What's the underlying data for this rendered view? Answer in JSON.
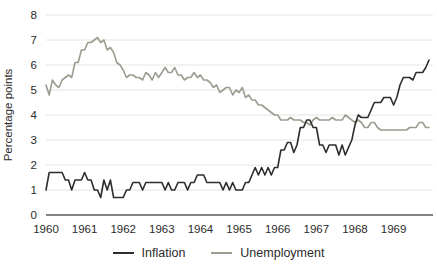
{
  "chart_data": {
    "type": "line",
    "title": "",
    "xlabel": "",
    "ylabel": "Percentage points",
    "frequency": "monthly",
    "x_start_year": 1960,
    "x_tick_labels": [
      "1960",
      "1961",
      "1962",
      "1963",
      "1964",
      "1965",
      "1966",
      "1967",
      "1968",
      "1969"
    ],
    "y_ticks": [
      0,
      1,
      2,
      3,
      4,
      5,
      6,
      7,
      8
    ],
    "ylim": [
      0,
      8
    ],
    "grid": "horizontal",
    "legend_position": "bottom",
    "series": [
      {
        "name": "Inflation",
        "color": "#2d2d2d",
        "values": [
          1.0,
          1.7,
          1.7,
          1.7,
          1.7,
          1.7,
          1.4,
          1.4,
          1.0,
          1.4,
          1.4,
          1.4,
          1.7,
          1.4,
          1.4,
          1.0,
          1.0,
          0.7,
          1.4,
          1.0,
          1.4,
          0.7,
          0.7,
          0.7,
          0.7,
          1.0,
          1.0,
          1.3,
          1.3,
          1.3,
          1.0,
          1.3,
          1.3,
          1.3,
          1.3,
          1.3,
          1.3,
          1.0,
          1.3,
          1.0,
          1.0,
          1.3,
          1.3,
          1.3,
          1.0,
          1.3,
          1.3,
          1.6,
          1.6,
          1.6,
          1.3,
          1.3,
          1.3,
          1.3,
          1.3,
          1.0,
          1.3,
          1.0,
          1.3,
          1.0,
          1.0,
          1.0,
          1.3,
          1.3,
          1.6,
          1.9,
          1.6,
          1.9,
          1.6,
          1.9,
          1.6,
          1.9,
          1.9,
          2.6,
          2.6,
          2.9,
          2.9,
          2.5,
          2.8,
          3.5,
          3.5,
          3.8,
          3.8,
          3.5,
          3.5,
          2.8,
          2.8,
          2.5,
          2.8,
          2.8,
          2.8,
          2.4,
          2.8,
          2.4,
          2.7,
          3.0,
          3.6,
          4.0,
          3.9,
          3.9,
          3.9,
          4.2,
          4.5,
          4.5,
          4.5,
          4.7,
          4.7,
          4.7,
          4.4,
          4.7,
          5.2,
          5.5,
          5.5,
          5.5,
          5.4,
          5.7,
          5.7,
          5.7,
          5.9,
          6.2
        ]
      },
      {
        "name": "Unemployment",
        "color": "#9c9c91",
        "values": [
          5.2,
          4.8,
          5.4,
          5.2,
          5.1,
          5.4,
          5.5,
          5.6,
          5.5,
          6.1,
          6.1,
          6.6,
          6.6,
          6.9,
          6.9,
          7.0,
          7.1,
          6.9,
          7.0,
          6.6,
          6.7,
          6.5,
          6.1,
          6.0,
          5.8,
          5.5,
          5.6,
          5.6,
          5.5,
          5.5,
          5.4,
          5.7,
          5.6,
          5.4,
          5.7,
          5.5,
          5.7,
          5.9,
          5.7,
          5.7,
          5.9,
          5.6,
          5.6,
          5.4,
          5.5,
          5.5,
          5.7,
          5.5,
          5.6,
          5.4,
          5.4,
          5.3,
          5.1,
          5.2,
          4.9,
          5.0,
          5.1,
          5.1,
          4.8,
          5.0,
          4.9,
          5.1,
          4.7,
          4.8,
          4.6,
          4.6,
          4.4,
          4.4,
          4.3,
          4.2,
          4.1,
          4.0,
          4.0,
          3.8,
          3.8,
          3.8,
          3.9,
          3.8,
          3.8,
          3.8,
          3.7,
          3.7,
          3.6,
          3.8,
          3.9,
          3.8,
          3.8,
          3.8,
          3.8,
          3.9,
          3.8,
          3.8,
          3.8,
          4.0,
          3.9,
          3.8,
          3.7,
          3.8,
          3.7,
          3.5,
          3.5,
          3.7,
          3.7,
          3.5,
          3.4,
          3.4,
          3.4,
          3.4,
          3.4,
          3.4,
          3.4,
          3.4,
          3.4,
          3.5,
          3.5,
          3.5,
          3.7,
          3.7,
          3.5,
          3.5
        ]
      }
    ],
    "colors": {
      "grid": "#e4e4df",
      "axis": "#5a5a58",
      "tick_text": "#2b2b2b"
    }
  }
}
